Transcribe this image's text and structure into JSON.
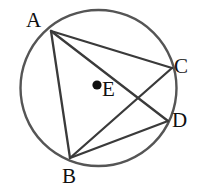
{
  "figure": {
    "kind": "circle-geometry-diagram",
    "width": 199,
    "height": 193,
    "background_color": "#ffffff"
  },
  "circle": {
    "name": "main-circle",
    "center_x": 98.5,
    "center_y": 88,
    "radius": 78,
    "stroke_color": "#555555",
    "stroke_width": 2.4,
    "fill": "none"
  },
  "center_marker": {
    "name": "center-dot",
    "x": 97,
    "y": 85,
    "radius": 4.6,
    "fill_color": "#101010"
  },
  "points": [
    {
      "id": "A",
      "label": "A",
      "x": 51,
      "y": 31,
      "on_circle": true,
      "label_x": 26,
      "label_y": 10
    },
    {
      "id": "B",
      "label": "B",
      "x": 70,
      "y": 158,
      "on_circle": true,
      "label_x": 62,
      "label_y": 166
    },
    {
      "id": "C",
      "label": "C",
      "x": 172,
      "y": 68,
      "on_circle": true,
      "label_x": 174,
      "label_y": 56
    },
    {
      "id": "D",
      "label": "D",
      "x": 168,
      "y": 121,
      "on_circle": true,
      "label_x": 172,
      "label_y": 110
    },
    {
      "id": "E",
      "label": "E",
      "x": 97,
      "y": 85,
      "on_circle": false,
      "label_x": 102,
      "label_y": 79
    }
  ],
  "chords": [
    {
      "name": "chord-AC",
      "from": "A",
      "to": "C",
      "x1": 51,
      "y1": 31,
      "x2": 172,
      "y2": 68
    },
    {
      "name": "chord-AD",
      "from": "A",
      "to": "D",
      "x1": 51,
      "y1": 31,
      "x2": 168,
      "y2": 121
    },
    {
      "name": "chord-AB",
      "from": "A",
      "to": "B",
      "x1": 51,
      "y1": 31,
      "x2": 70,
      "y2": 158
    },
    {
      "name": "chord-BC",
      "from": "B",
      "to": "C",
      "x1": 70,
      "y1": 158,
      "x2": 172,
      "y2": 68
    },
    {
      "name": "chord-BD",
      "from": "B",
      "to": "D",
      "x1": 70,
      "y1": 158,
      "x2": 168,
      "y2": 121
    }
  ],
  "chord_style": {
    "stroke_color": "#3a3a3a",
    "stroke_width": 2.3
  }
}
